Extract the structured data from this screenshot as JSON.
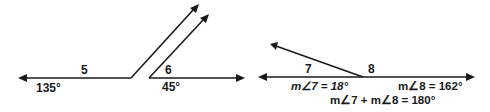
{
  "diagram": {
    "left_figure": {
      "angle_5": {
        "label": "5",
        "measure": "135°"
      },
      "angle_6": {
        "label": "6",
        "measure": "45°"
      }
    },
    "right_figure": {
      "angle_7": {
        "label": "7",
        "equation": "m∠7 = 18°"
      },
      "angle_8": {
        "label": "8",
        "equation": "m∠8 = 162°"
      },
      "sum_equation": "m∠7 +  m∠8 = 180°"
    }
  }
}
